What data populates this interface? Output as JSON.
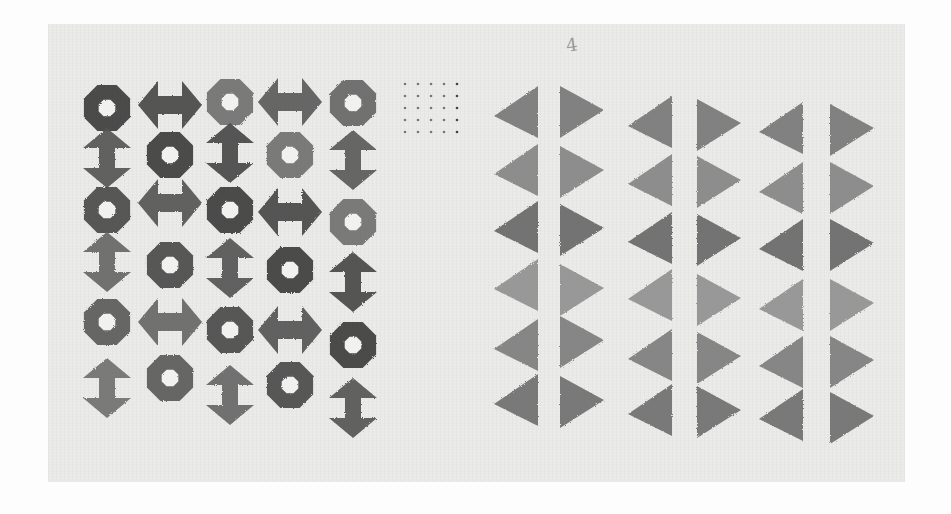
{
  "image": {
    "description": "Photograph of a printed artwork on paper: left panel grid of stamped rings and double-headed arrows, small dot grid in middle, right panel of six columns of stamped triangles",
    "colors": {
      "background": "#fdfdfd",
      "paper": "#e9e9e7",
      "ink_dark": "#3a3a3a",
      "ink_mid": "#6a6a6a",
      "ink_light": "#8e8e8e"
    },
    "annotation_mark": "4"
  },
  "left_panel": {
    "columns": [
      {
        "x": 107,
        "items": [
          {
            "type": "ring",
            "y": 108
          },
          {
            "type": "v-arrow",
            "y": 158
          },
          {
            "type": "ring",
            "y": 210
          },
          {
            "type": "v-arrow",
            "y": 262
          },
          {
            "type": "ring",
            "y": 322
          },
          {
            "type": "v-arrow",
            "y": 388
          }
        ]
      },
      {
        "x": 170,
        "items": [
          {
            "type": "h-arrow",
            "y": 105
          },
          {
            "type": "ring",
            "y": 155
          },
          {
            "type": "h-arrow",
            "y": 203
          },
          {
            "type": "ring",
            "y": 265
          },
          {
            "type": "h-arrow",
            "y": 322
          },
          {
            "type": "ring",
            "y": 378
          }
        ]
      },
      {
        "x": 230,
        "items": [
          {
            "type": "ring",
            "y": 102
          },
          {
            "type": "v-arrow",
            "y": 153
          },
          {
            "type": "ring",
            "y": 210
          },
          {
            "type": "v-arrow",
            "y": 268
          },
          {
            "type": "ring",
            "y": 330
          },
          {
            "type": "v-arrow",
            "y": 395
          }
        ]
      },
      {
        "x": 290,
        "items": [
          {
            "type": "h-arrow",
            "y": 102
          },
          {
            "type": "ring",
            "y": 155
          },
          {
            "type": "h-arrow",
            "y": 212
          },
          {
            "type": "ring",
            "y": 270
          },
          {
            "type": "h-arrow",
            "y": 330
          },
          {
            "type": "ring",
            "y": 385
          }
        ]
      },
      {
        "x": 353,
        "items": [
          {
            "type": "ring",
            "y": 103
          },
          {
            "type": "v-arrow",
            "y": 160
          },
          {
            "type": "ring",
            "y": 222
          },
          {
            "type": "v-arrow",
            "y": 282
          },
          {
            "type": "ring",
            "y": 345
          },
          {
            "type": "v-arrow",
            "y": 408
          }
        ]
      }
    ]
  },
  "dot_grid": {
    "x0": 405,
    "y0": 84,
    "cols": 5,
    "rows": 5,
    "dx": 13,
    "dy": 12
  },
  "right_panel": {
    "columns": [
      {
        "edge_x": 538,
        "dir": "left",
        "ys": [
          112,
          170,
          227,
          285,
          345,
          400
        ]
      },
      {
        "edge_x": 560,
        "dir": "right",
        "ys": [
          112,
          172,
          230,
          290,
          342,
          402
        ]
      },
      {
        "edge_x": 672,
        "dir": "left",
        "ys": [
          122,
          180,
          238,
          295,
          355,
          410
        ]
      },
      {
        "edge_x": 697,
        "dir": "right",
        "ys": [
          125,
          182,
          240,
          300,
          358,
          412
        ]
      },
      {
        "edge_x": 803,
        "dir": "left",
        "ys": [
          128,
          188,
          245,
          305,
          362,
          415
        ]
      },
      {
        "edge_x": 830,
        "dir": "right",
        "ys": [
          130,
          188,
          245,
          305,
          362,
          418
        ]
      }
    ],
    "triangle_w": 44,
    "triangle_h": 52
  }
}
